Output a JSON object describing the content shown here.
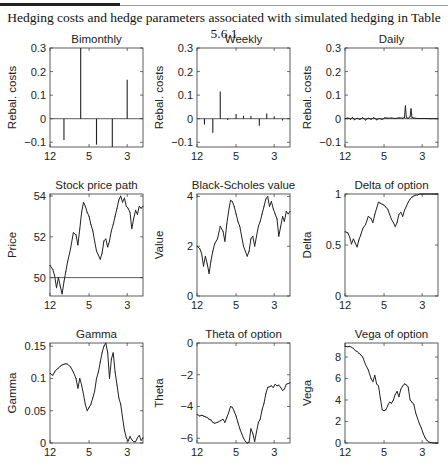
{
  "caption": "Hedging costs and hedge parameters associated with simulated hedging in Table 5.6.1",
  "chart_data": [
    {
      "type": "bar",
      "id": "bimonthly",
      "title": "Bimonthly",
      "ylabel": "Rebal. costs",
      "xlabel": "",
      "ylim": [
        -0.12,
        0.3
      ],
      "yticks": [
        -0.1,
        0,
        0.1,
        0.2,
        0.3
      ],
      "yticklabels": [
        "−0.1",
        "0",
        "0.1",
        "0.2",
        "0.3"
      ],
      "xlim": [
        0,
        1
      ],
      "xticks": [
        0,
        0.42,
        0.83
      ],
      "xticklabels": [
        "12",
        "5",
        "3"
      ],
      "zero_line": 0,
      "x": [
        0.15,
        0.33,
        0.5,
        0.67,
        0.83
      ],
      "values": [
        -0.09,
        0.3,
        -0.11,
        -0.12,
        0.165
      ]
    },
    {
      "type": "bar",
      "id": "weekly",
      "title": "Weekly",
      "ylabel": "Rebal. costs",
      "xlabel": "",
      "ylim": [
        -0.12,
        0.3
      ],
      "yticks": [
        -0.1,
        0,
        0.1,
        0.2,
        0.3
      ],
      "yticklabels": [
        "−0.1",
        "0",
        "0.1",
        "0.2",
        "0.3"
      ],
      "xlim": [
        0,
        1
      ],
      "xticks": [
        0,
        0.42,
        0.83
      ],
      "xticklabels": [
        "12",
        "5",
        "3"
      ],
      "zero_line": 0,
      "x": [
        0.08,
        0.17,
        0.25,
        0.33,
        0.42,
        0.5,
        0.58,
        0.67,
        0.75,
        0.83,
        0.92
      ],
      "values": [
        -0.025,
        -0.06,
        0.115,
        -0.005,
        0.02,
        0.012,
        0.012,
        -0.03,
        0.022,
        0.01,
        -0.008
      ]
    },
    {
      "type": "line",
      "id": "daily",
      "title": "Daily",
      "ylabel": "Rebal. costs",
      "xlabel": "",
      "ylim": [
        -0.12,
        0.3
      ],
      "yticks": [
        -0.1,
        0,
        0.1,
        0.2,
        0.3
      ],
      "yticklabels": [
        "−0.1",
        "0",
        "0.1",
        "0.2",
        "0.3"
      ],
      "xlim": [
        0,
        1
      ],
      "xticks": [
        0,
        0.42,
        0.83
      ],
      "xticklabels": [
        "12",
        "5",
        "3"
      ],
      "zero_line": 0,
      "x": [
        0,
        0.03,
        0.06,
        0.08,
        0.1,
        0.13,
        0.16,
        0.19,
        0.22,
        0.25,
        0.28,
        0.31,
        0.34,
        0.37,
        0.4,
        0.43,
        0.46,
        0.5,
        0.54,
        0.58,
        0.62,
        0.64,
        0.65,
        0.66,
        0.68,
        0.7,
        0.71,
        0.72,
        0.74,
        0.78,
        0.85,
        0.92,
        1.0
      ],
      "values": [
        0,
        0.003,
        -0.002,
        0.006,
        -0.004,
        0.002,
        -0.003,
        0.004,
        -0.005,
        0.002,
        -0.002,
        0.004,
        -0.004,
        0.001,
        -0.003,
        0.004,
        0.002,
        0.003,
        0.001,
        0.004,
        0.002,
        0.005,
        0.055,
        0.004,
        0.002,
        0.008,
        0.042,
        0.005,
        0.003,
        0.001,
        0.001,
        0,
        0
      ]
    },
    {
      "type": "line",
      "id": "stock-price",
      "title": "Stock price path",
      "ylabel": "Price",
      "xlabel": "",
      "ylim": [
        49.1,
        54.1
      ],
      "yticks": [
        50,
        52,
        54
      ],
      "yticklabels": [
        "50",
        "52",
        "54"
      ],
      "xlim": [
        0,
        1
      ],
      "xticks": [
        0,
        0.42,
        0.83
      ],
      "xticklabels": [
        "12",
        "5",
        "3"
      ],
      "reference_line": 50,
      "x": [
        0,
        0.03,
        0.05,
        0.07,
        0.09,
        0.11,
        0.13,
        0.15,
        0.17,
        0.19,
        0.22,
        0.25,
        0.28,
        0.3,
        0.32,
        0.34,
        0.36,
        0.38,
        0.4,
        0.42,
        0.44,
        0.46,
        0.48,
        0.5,
        0.52,
        0.54,
        0.56,
        0.58,
        0.6,
        0.62,
        0.64,
        0.66,
        0.68,
        0.7,
        0.72,
        0.74,
        0.76,
        0.78,
        0.8,
        0.82,
        0.84,
        0.86,
        0.88,
        0.9,
        0.92,
        0.94,
        0.96,
        0.98,
        1.0
      ],
      "values": [
        50.6,
        50.4,
        50.1,
        49.5,
        50.0,
        49.6,
        49.2,
        49.8,
        50.3,
        50.8,
        51.4,
        52.2,
        52.1,
        51.6,
        52.4,
        53.2,
        53.7,
        53.5,
        53.2,
        53.0,
        52.6,
        52.3,
        51.8,
        51.3,
        51.1,
        50.9,
        51.2,
        51.8,
        51.9,
        51.5,
        51.8,
        52.3,
        52.6,
        53.0,
        53.4,
        53.8,
        54.0,
        53.7,
        53.9,
        53.5,
        53.4,
        53.2,
        52.4,
        52.9,
        53.3,
        53.1,
        53.5,
        53.4,
        53.5
      ]
    },
    {
      "type": "line",
      "id": "black-scholes",
      "title": "Black-Scholes value",
      "ylabel": "Value",
      "xlabel": "",
      "ylim": [
        0,
        4.1
      ],
      "yticks": [
        0,
        2,
        4
      ],
      "yticklabels": [
        "0",
        "2",
        "4"
      ],
      "xlim": [
        0,
        1
      ],
      "xticks": [
        0,
        0.42,
        0.83
      ],
      "xticklabels": [
        "12",
        "5",
        "3"
      ],
      "x": [
        0,
        0.03,
        0.05,
        0.07,
        0.09,
        0.11,
        0.13,
        0.15,
        0.17,
        0.19,
        0.22,
        0.25,
        0.28,
        0.3,
        0.32,
        0.34,
        0.36,
        0.38,
        0.4,
        0.42,
        0.44,
        0.46,
        0.48,
        0.5,
        0.52,
        0.54,
        0.56,
        0.58,
        0.6,
        0.62,
        0.64,
        0.66,
        0.68,
        0.7,
        0.72,
        0.74,
        0.76,
        0.78,
        0.8,
        0.82,
        0.84,
        0.86,
        0.88,
        0.9,
        0.92,
        0.94,
        0.96,
        0.98,
        1.0
      ],
      "values": [
        2.0,
        1.9,
        1.7,
        1.2,
        1.6,
        1.3,
        0.9,
        1.4,
        1.8,
        2.1,
        2.3,
        2.8,
        2.6,
        2.2,
        2.9,
        3.4,
        3.85,
        3.8,
        3.6,
        3.3,
        3.0,
        2.8,
        2.4,
        2.0,
        1.8,
        1.6,
        1.8,
        2.3,
        2.4,
        2.0,
        2.4,
        2.8,
        3.0,
        3.3,
        3.6,
        3.9,
        4.0,
        3.6,
        3.8,
        3.5,
        3.3,
        3.1,
        2.4,
        2.8,
        3.2,
        3.0,
        3.4,
        3.3,
        3.4
      ]
    },
    {
      "type": "line",
      "id": "delta",
      "title": "Delta of option",
      "ylabel": "Delta",
      "xlabel": "",
      "ylim": [
        0,
        1
      ],
      "yticks": [
        0,
        0.5,
        1
      ],
      "yticklabels": [
        "0",
        "0.5",
        "1"
      ],
      "xlim": [
        0,
        1
      ],
      "xticks": [
        0,
        0.42,
        0.83
      ],
      "xticklabels": [
        "12",
        "5",
        "3"
      ],
      "x": [
        0,
        0.03,
        0.05,
        0.07,
        0.09,
        0.11,
        0.13,
        0.15,
        0.17,
        0.19,
        0.22,
        0.25,
        0.28,
        0.3,
        0.32,
        0.34,
        0.36,
        0.38,
        0.4,
        0.42,
        0.44,
        0.46,
        0.48,
        0.5,
        0.52,
        0.54,
        0.56,
        0.58,
        0.6,
        0.62,
        0.64,
        0.66,
        0.68,
        0.7,
        0.72,
        0.74,
        0.76,
        0.78,
        0.8,
        0.82,
        0.84,
        0.86,
        0.88,
        0.9,
        0.92,
        0.94,
        0.96,
        0.98,
        1.0
      ],
      "values": [
        0.63,
        0.62,
        0.58,
        0.51,
        0.56,
        0.52,
        0.48,
        0.55,
        0.6,
        0.66,
        0.7,
        0.78,
        0.76,
        0.72,
        0.8,
        0.86,
        0.92,
        0.91,
        0.9,
        0.89,
        0.87,
        0.85,
        0.8,
        0.75,
        0.72,
        0.68,
        0.72,
        0.8,
        0.82,
        0.78,
        0.84,
        0.88,
        0.92,
        0.95,
        0.97,
        0.98,
        0.99,
        0.99,
        1.0,
        1.0,
        1.0,
        1.0,
        1.0,
        1.0,
        1.0,
        1.0,
        1.0,
        1.0,
        1.0
      ]
    },
    {
      "type": "line",
      "id": "gamma",
      "title": "Gamma",
      "ylabel": "Gamma",
      "xlabel": "",
      "ylim": [
        0,
        0.155
      ],
      "yticks": [
        0,
        0.05,
        0.1,
        0.15
      ],
      "yticklabels": [
        "0",
        "0.05",
        "0.1",
        "0.15"
      ],
      "xlim": [
        0,
        1
      ],
      "xticks": [
        0,
        0.42,
        0.83
      ],
      "xticklabels": [
        "12",
        "5",
        "3"
      ],
      "x": [
        0,
        0.03,
        0.05,
        0.07,
        0.09,
        0.11,
        0.13,
        0.15,
        0.17,
        0.19,
        0.22,
        0.25,
        0.28,
        0.3,
        0.32,
        0.34,
        0.36,
        0.38,
        0.4,
        0.42,
        0.44,
        0.46,
        0.48,
        0.5,
        0.52,
        0.54,
        0.56,
        0.58,
        0.6,
        0.62,
        0.64,
        0.66,
        0.68,
        0.7,
        0.72,
        0.74,
        0.76,
        0.78,
        0.8,
        0.82,
        0.84,
        0.86,
        0.88,
        0.9,
        0.92,
        0.94,
        0.96,
        0.98,
        1.0
      ],
      "values": [
        0.108,
        0.105,
        0.11,
        0.114,
        0.116,
        0.119,
        0.121,
        0.122,
        0.123,
        0.122,
        0.118,
        0.11,
        0.1,
        0.085,
        0.1,
        0.09,
        0.075,
        0.06,
        0.05,
        0.055,
        0.06,
        0.07,
        0.08,
        0.1,
        0.11,
        0.125,
        0.14,
        0.15,
        0.155,
        0.14,
        0.1,
        0.13,
        0.14,
        0.11,
        0.09,
        0.07,
        0.06,
        0.04,
        0.02,
        0.008,
        0.003,
        0.01,
        0.005,
        0.002,
        0.002,
        0.008,
        0.012,
        0.004,
        0.008
      ]
    },
    {
      "type": "line",
      "id": "theta",
      "title": "Theta of option",
      "ylabel": "Theta",
      "xlabel": "",
      "ylim": [
        -6.3,
        0
      ],
      "yticks": [
        -6,
        -4,
        -2,
        0
      ],
      "yticklabels": [
        "−6",
        "−4",
        "−2",
        "0"
      ],
      "xlim": [
        0,
        1
      ],
      "xticks": [
        0,
        0.42,
        0.83
      ],
      "xticklabels": [
        "12",
        "5",
        "3"
      ],
      "x": [
        0,
        0.03,
        0.05,
        0.07,
        0.09,
        0.11,
        0.13,
        0.15,
        0.17,
        0.19,
        0.22,
        0.25,
        0.28,
        0.3,
        0.32,
        0.34,
        0.36,
        0.38,
        0.4,
        0.42,
        0.44,
        0.46,
        0.48,
        0.5,
        0.52,
        0.54,
        0.56,
        0.58,
        0.6,
        0.62,
        0.64,
        0.66,
        0.68,
        0.7,
        0.72,
        0.74,
        0.76,
        0.78,
        0.8,
        0.82,
        0.84,
        0.86,
        0.88,
        0.9,
        0.92,
        0.94,
        0.96,
        0.98,
        1.0
      ],
      "values": [
        -4.5,
        -4.6,
        -4.55,
        -4.6,
        -4.65,
        -4.7,
        -4.8,
        -4.85,
        -5.0,
        -5.05,
        -5.0,
        -4.9,
        -4.8,
        -5.0,
        -4.7,
        -4.4,
        -4.0,
        -4.05,
        -4.3,
        -4.6,
        -5.0,
        -5.4,
        -5.7,
        -6.0,
        -6.2,
        -6.3,
        -6.25,
        -5.4,
        -5.7,
        -6.2,
        -5.6,
        -5.0,
        -4.8,
        -4.2,
        -3.8,
        -3.2,
        -2.8,
        -2.75,
        -2.7,
        -2.8,
        -2.6,
        -2.7,
        -2.65,
        -2.8,
        -3.0,
        -2.9,
        -2.6,
        -2.55,
        -2.5
      ]
    },
    {
      "type": "line",
      "id": "vega",
      "title": "Vega of option",
      "ylabel": "Vega",
      "xlabel": "",
      "ylim": [
        0,
        9.3
      ],
      "yticks": [
        0,
        2,
        4,
        6,
        8
      ],
      "yticklabels": [
        "0",
        "2",
        "4",
        "6",
        "8"
      ],
      "xlim": [
        0,
        1
      ],
      "xticks": [
        0,
        0.42,
        0.83
      ],
      "xticklabels": [
        "12",
        "5",
        "3"
      ],
      "x": [
        0,
        0.03,
        0.05,
        0.07,
        0.09,
        0.11,
        0.13,
        0.15,
        0.17,
        0.19,
        0.22,
        0.25,
        0.28,
        0.3,
        0.32,
        0.34,
        0.36,
        0.38,
        0.4,
        0.42,
        0.44,
        0.46,
        0.48,
        0.5,
        0.52,
        0.54,
        0.56,
        0.58,
        0.6,
        0.62,
        0.64,
        0.66,
        0.68,
        0.7,
        0.72,
        0.74,
        0.76,
        0.78,
        0.8,
        0.82,
        0.84,
        0.86,
        0.88,
        0.9,
        0.92,
        0.94,
        0.96,
        0.98,
        1.0
      ],
      "values": [
        9.0,
        8.95,
        9.0,
        8.9,
        8.8,
        8.6,
        8.5,
        8.35,
        8.2,
        8.0,
        7.3,
        6.8,
        6.0,
        5.7,
        6.3,
        5.5,
        5.3,
        4.2,
        3.1,
        3.0,
        3.1,
        3.5,
        3.8,
        3.7,
        4.0,
        4.5,
        4.8,
        4.3,
        5.0,
        5.3,
        5.5,
        5.4,
        5.2,
        4.0,
        3.8,
        3.6,
        2.8,
        2.3,
        1.8,
        1.4,
        0.9,
        0.5,
        0.25,
        0.1,
        0.05,
        0.02,
        0.01,
        0.0,
        0.0
      ]
    }
  ]
}
